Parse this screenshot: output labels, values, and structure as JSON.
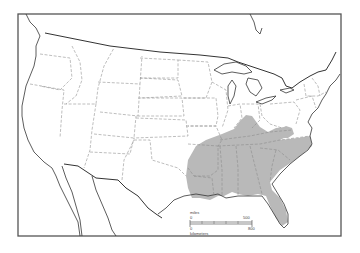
{
  "map": {
    "type": "species range map",
    "region": "United States, southern Canada and northern Mexico",
    "shaded_range": {
      "description": "Southeastern United States",
      "color": "#b9b9b9"
    },
    "scale_bar": {
      "miles_label": "miles",
      "miles_start": "0",
      "miles_end": "500",
      "km_label": "kilometers",
      "km_start": "0",
      "km_end": "800"
    },
    "colors": {
      "background": "#ffffff",
      "outline": "#333333",
      "state_lines": "#888888"
    }
  }
}
